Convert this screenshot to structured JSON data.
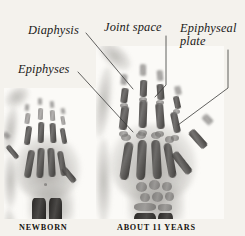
{
  "figure": {
    "background_color": "#f4f2ed",
    "width": 245,
    "height": 236
  },
  "annotations": [
    {
      "id": "diaphysis",
      "label": "Diaphysis",
      "style": "italic-serif",
      "text_x": 28,
      "text_y": 24,
      "leader": {
        "points": "86,33 133,89",
        "target": "shaft of middle phalanx, index finger, 11-year hand"
      }
    },
    {
      "id": "epiphyses",
      "label": "Epiphyses",
      "style": "italic-serif",
      "text_x": 18,
      "text_y": 63,
      "leader": {
        "points": "78,72 133,132",
        "target": "epiphysis at base of index finger proximal phalanx, 11-year hand"
      }
    },
    {
      "id": "joint-space",
      "label": "Joint space",
      "style": "italic-serif",
      "text_x": 104,
      "text_y": 21,
      "leader": {
        "points": "166,36 166,85 155,97",
        "target": "interphalangeal joint space, middle finger, 11-year hand"
      }
    },
    {
      "id": "epiphyseal-plate",
      "label": "Epiphyseal plate",
      "line1": "Epiphyseal",
      "line2": "plate",
      "style": "italic-serif",
      "text_x": 180,
      "text_y": 22,
      "leader": {
        "points": "228,50 228,88 178,125",
        "target": "epiphyseal growth plate, ring finger, 11-year hand"
      }
    }
  ],
  "captions": [
    {
      "id": "newborn",
      "text": "NEWBORN",
      "x": 19,
      "y": 223
    },
    {
      "id": "about-11-years",
      "text": "ABOUT 11 YEARS",
      "x": 117,
      "y": 223
    }
  ],
  "panels": [
    {
      "id": "newborn-xray",
      "caption": "NEWBORN",
      "x": 4,
      "y": 88,
      "width": 92,
      "height": 131,
      "description": "Radiograph of a newborn hand: only the diaphyses of the metacarpals and phalanges are ossified; carpal bones and epiphyses are still cartilage and not visible."
    },
    {
      "id": "eleven-year-xray",
      "caption": "ABOUT 11 YEARS",
      "x": 96,
      "y": 46,
      "width": 128,
      "height": 173,
      "description": "Radiograph of an approximately 11-year-old hand: epiphyses are ossified and separated from the diaphyses by radiolucent epiphyseal plates; carpal bones are visible."
    }
  ],
  "colors": {
    "background": "#f4f2ed",
    "plate": "#fbfaf7",
    "bone": "#3c3a38",
    "text": "#1b1a18",
    "leader_line": "#3a3a38"
  }
}
